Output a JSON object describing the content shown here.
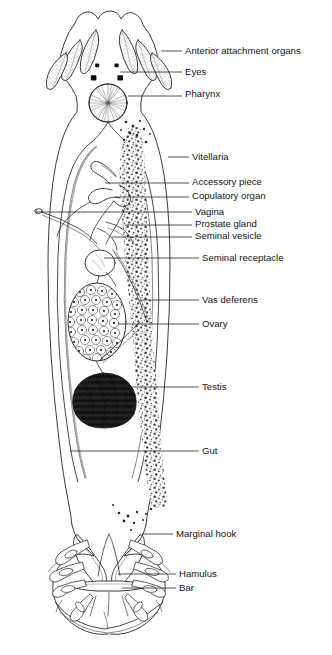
{
  "figure": {
    "kind": "anatomical-diagram",
    "background_color": "#ffffff",
    "ink_color": "#1a1a1a",
    "label_color": "#141414"
  },
  "labels": [
    {
      "id": "anterior-attachment-organs",
      "text": "Anterior attachment organs",
      "x": 185,
      "y": 54,
      "leader": {
        "x1": 161,
        "y1": 51,
        "x2": 182,
        "y2": 51
      }
    },
    {
      "id": "eyes",
      "text": "Eyes",
      "x": 185,
      "y": 75,
      "leader": {
        "x1": 120,
        "y1": 72,
        "x2": 182,
        "y2": 72
      }
    },
    {
      "id": "pharynx",
      "text": "Pharynx",
      "x": 185,
      "y": 97,
      "leader": {
        "x1": 128,
        "y1": 96,
        "x2": 182,
        "y2": 96
      }
    },
    {
      "id": "vitellaria",
      "text": "Vitellaria",
      "x": 192,
      "y": 160,
      "leader": {
        "x1": 168,
        "y1": 157,
        "x2": 189,
        "y2": 157
      }
    },
    {
      "id": "accessory-piece",
      "text": "Accessory piece",
      "x": 192,
      "y": 185,
      "leader": {
        "x1": 105,
        "y1": 183,
        "x2": 189,
        "y2": 183
      }
    },
    {
      "id": "copulatory-organ",
      "text": "Copulatory organ",
      "x": 192,
      "y": 199,
      "leader": {
        "x1": 115,
        "y1": 197,
        "x2": 189,
        "y2": 197
      }
    },
    {
      "id": "vagina",
      "text": "Vagina",
      "x": 195,
      "y": 215,
      "leader": {
        "x1": 37,
        "y1": 212,
        "x2": 192,
        "y2": 212
      }
    },
    {
      "id": "prostate-gland",
      "text": "Prostate gland",
      "x": 195,
      "y": 227,
      "leader": {
        "x1": 125,
        "y1": 225,
        "x2": 192,
        "y2": 225
      }
    },
    {
      "id": "seminal-vesicle",
      "text": "Seminal vesicle",
      "x": 195,
      "y": 239,
      "leader": {
        "x1": 112,
        "y1": 237,
        "x2": 192,
        "y2": 237
      }
    },
    {
      "id": "seminal-receptacle",
      "text": "Seminal receptacle",
      "x": 202,
      "y": 261,
      "leader": {
        "x1": 104,
        "y1": 258,
        "x2": 199,
        "y2": 258
      }
    },
    {
      "id": "vas-deferens",
      "text": "Vas deferens",
      "x": 202,
      "y": 303,
      "leader": {
        "x1": 142,
        "y1": 300,
        "x2": 199,
        "y2": 300
      }
    },
    {
      "id": "ovary",
      "text": "Ovary",
      "x": 202,
      "y": 327,
      "leader": {
        "x1": 118,
        "y1": 324,
        "x2": 199,
        "y2": 324
      }
    },
    {
      "id": "testis",
      "text": "Testis",
      "x": 202,
      "y": 390,
      "leader": {
        "x1": 130,
        "y1": 387,
        "x2": 199,
        "y2": 387
      }
    },
    {
      "id": "gut",
      "text": "Gut",
      "x": 202,
      "y": 454,
      "leader": {
        "x1": 70,
        "y1": 451,
        "x2": 199,
        "y2": 451
      }
    },
    {
      "id": "marginal-hook",
      "text": "Marginal hook",
      "x": 176,
      "y": 537,
      "leader": {
        "x1": 142,
        "y1": 534,
        "x2": 173,
        "y2": 534
      }
    },
    {
      "id": "hamulus",
      "text": "Hamulus",
      "x": 179,
      "y": 577,
      "leader": {
        "x1": 118,
        "y1": 574,
        "x2": 176,
        "y2": 574
      }
    },
    {
      "id": "bar",
      "text": "Bar",
      "x": 179,
      "y": 591,
      "leader": {
        "x1": 122,
        "y1": 588,
        "x2": 176,
        "y2": 588
      }
    }
  ],
  "structures": [
    {
      "id": "body-outline",
      "name": "body-outline"
    },
    {
      "id": "anterior-attachment-organs",
      "name": "anterior-attachment-organs",
      "count": 6
    },
    {
      "id": "eyespots",
      "name": "eyespots",
      "count": 4
    },
    {
      "id": "pharynx",
      "name": "pharynx",
      "cx": 108,
      "cy": 103,
      "r": 19
    },
    {
      "id": "vitellaria",
      "name": "vitellaria-field"
    },
    {
      "id": "gut-caeca",
      "name": "gut-caeca",
      "count": 2
    },
    {
      "id": "copulatory-complex",
      "name": "copulatory-complex"
    },
    {
      "id": "seminal-vesicle",
      "name": "seminal-vesicle"
    },
    {
      "id": "seminal-receptacle",
      "name": "seminal-receptacle"
    },
    {
      "id": "ovary",
      "name": "ovary",
      "cx": 97,
      "cy": 322,
      "rx": 29,
      "ry": 39
    },
    {
      "id": "testis",
      "name": "testis",
      "cx": 103,
      "cy": 400,
      "rx": 32,
      "ry": 27
    },
    {
      "id": "haptor",
      "name": "haptor"
    },
    {
      "id": "hamuli",
      "name": "hamuli",
      "count": 2
    },
    {
      "id": "bar",
      "name": "transverse-bar"
    },
    {
      "id": "marginal-hooks",
      "name": "marginal-hooks",
      "count": 14
    }
  ]
}
